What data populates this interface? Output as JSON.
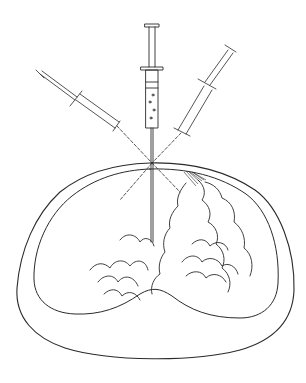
{
  "figure": {
    "type": "medical-illustration",
    "colors": {
      "background": "#ffffff",
      "ink": "#2a2a2a"
    },
    "entry_point": {
      "x": 152,
      "y": 163
    },
    "syringes": [
      {
        "name": "left-syringe",
        "angle_deg": -56,
        "style": "dashed"
      },
      {
        "name": "center-syringe",
        "angle_deg": 0,
        "style": "solid"
      },
      {
        "name": "right-syringe",
        "angle_deg": 35,
        "style": "dashed"
      }
    ]
  }
}
